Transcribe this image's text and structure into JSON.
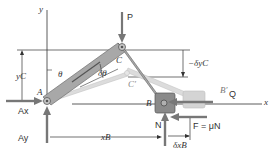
{
  "figure": {
    "colors": {
      "link_fill": "#a8a8a8",
      "link_stroke": "#6f6f6f",
      "ghost_link": "#d4d4d4",
      "collar": "#8a8a8a",
      "collar_ghost": "#d0d0d0",
      "arrow": "#777777",
      "line": "#333333"
    }
  },
  "labels": {
    "y_axis": "y",
    "x_axis": "x",
    "force_P": "P",
    "point_C": "C",
    "point_C_prime": "C′",
    "point_A": "A",
    "point_B": "B",
    "point_B_prime": "B′",
    "force_Q": "Q",
    "reaction_Ax": "Ax",
    "reaction_Ay": "Ay",
    "reaction_N": "N",
    "friction": "F = μN",
    "angle_theta": "θ",
    "angle_delta_theta": "δθ",
    "dim_yC": "yC",
    "dim_delta_yC": "−δyC",
    "dim_xB": "xB",
    "dim_delta_xB": "δxB"
  }
}
